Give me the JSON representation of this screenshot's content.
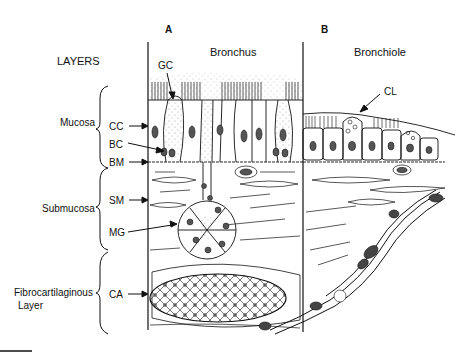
{
  "diagram": {
    "header": {
      "layers_title": "LAYERS"
    },
    "panels": [
      {
        "id": "A",
        "letter": "A",
        "title": "Bronchus"
      },
      {
        "id": "B",
        "letter": "B",
        "title": "Bronchiole"
      }
    ],
    "layers": [
      {
        "name": "Mucosa",
        "abbreviations": [
          "CC",
          "BC",
          "BM"
        ]
      },
      {
        "name": "Submucosa",
        "abbreviations": [
          "SM",
          "MG"
        ]
      },
      {
        "name_line1": "Fibrocartilaginous",
        "name_line2": "Layer",
        "abbreviations": [
          "CA"
        ]
      }
    ],
    "labels": {
      "gc": "GC",
      "cl": "CL",
      "cc": "CC",
      "bc": "BC",
      "bm": "BM",
      "sm": "SM",
      "mg": "MG",
      "ca": "CA"
    },
    "colors": {
      "ink": "#111111",
      "background": "#ffffff",
      "stipple": "#777777"
    }
  }
}
